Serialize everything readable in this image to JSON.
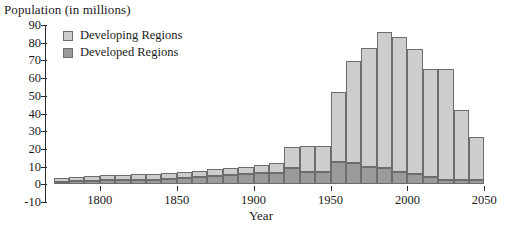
{
  "chart_data": {
    "type": "bar",
    "stacked": true,
    "title": "Population (in millions)",
    "xlabel": "Year",
    "ylabel": "Population (in millions)",
    "ylim": [
      -10,
      90
    ],
    "ytick_step": 10,
    "yticks": [
      90,
      80,
      70,
      60,
      50,
      40,
      30,
      20,
      10,
      0,
      -10
    ],
    "xlim": [
      1765,
      2055
    ],
    "xticks": [
      1800,
      1850,
      1900,
      1950,
      2000,
      2050
    ],
    "xtick_labels": [
      "1800",
      "1850",
      "1900",
      "1950",
      "2000",
      "2050"
    ],
    "grid": false,
    "legend_position": "top-left",
    "bar_interval_years": 10,
    "categories": [
      "1770",
      "1780",
      "1790",
      "1800",
      "1810",
      "1820",
      "1830",
      "1840",
      "1850",
      "1860",
      "1870",
      "1880",
      "1890",
      "1900",
      "1910",
      "1920",
      "1930",
      "1940",
      "1950",
      "1960",
      "1970",
      "1980",
      "1990",
      "2000",
      "2010",
      "2020",
      "2030",
      "2040"
    ],
    "series": [
      {
        "name": "Developed Regions",
        "color": "#9a9a9a",
        "values": [
          1.5,
          2.0,
          2.0,
          2.2,
          2.4,
          2.5,
          2.6,
          3.0,
          3.4,
          4.2,
          4.8,
          5.3,
          5.8,
          6.2,
          6.6,
          9.0,
          6.8,
          6.8,
          12.6,
          11.8,
          9.8,
          9.0,
          7.0,
          5.6,
          4.4,
          2.6,
          2.2,
          2.4
        ]
      },
      {
        "name": "Developing Regions",
        "color": "#cdcdcd",
        "values": [
          2.0,
          2.4,
          2.7,
          3.0,
          3.1,
          3.3,
          3.5,
          3.6,
          3.6,
          3.4,
          3.6,
          3.7,
          3.8,
          5.0,
          5.3,
          12.1,
          14.6,
          15.0,
          39.8,
          57.8,
          67.2,
          77.2,
          76.4,
          70.8,
          60.8,
          62.6,
          39.8,
          24.6
        ]
      }
    ],
    "totals": [
      3.5,
      4.4,
      4.7,
      5.2,
      5.5,
      5.8,
      6.1,
      6.6,
      7.0,
      7.6,
      8.4,
      9.0,
      9.6,
      11.2,
      11.9,
      21.1,
      21.4,
      21.8,
      52.4,
      69.6,
      77.0,
      86.2,
      83.4,
      76.4,
      65.2,
      65.2,
      42.0,
      27.0
    ],
    "legend": [
      {
        "label": "Developing Regions",
        "swatch": "light-gray-swatch"
      },
      {
        "label": "Developed Regions",
        "swatch": "dark-gray-swatch"
      }
    ]
  }
}
